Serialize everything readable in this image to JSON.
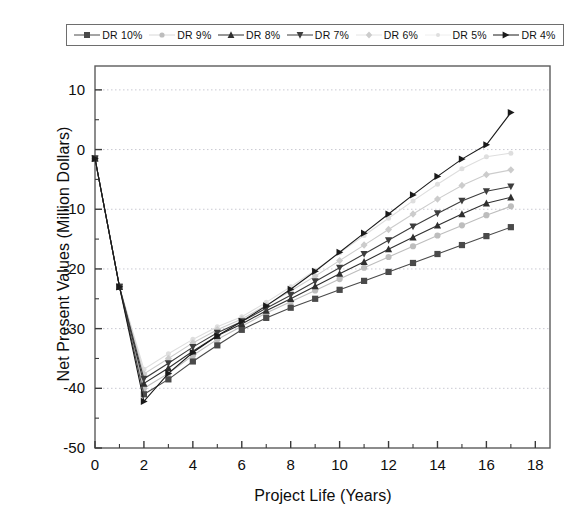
{
  "chart_data": {
    "type": "line",
    "title": "",
    "xlabel": "Project Life (Years)",
    "ylabel": "Net Present Values (Million Dollars)",
    "xlim": [
      0,
      18.6
    ],
    "ylim": [
      -50,
      14
    ],
    "xticks": [
      0,
      2,
      4,
      6,
      8,
      10,
      12,
      14,
      16,
      18
    ],
    "yticks": [
      10,
      0,
      -10,
      -20,
      -30,
      -40,
      -50
    ],
    "xtick_labels": [
      "0",
      "2",
      "4",
      "6",
      "8",
      "10",
      "12",
      "14",
      "16",
      "18"
    ],
    "ytick_labels": [
      "10",
      "0",
      "-10",
      "-20",
      "-30",
      "-40",
      "-50"
    ],
    "x_minor_step": 1,
    "y_minor_step": 5,
    "grid": "horizontal-dotted",
    "legend_position": "top-outside",
    "x": [
      0,
      1,
      2,
      3,
      4,
      5,
      6,
      7,
      8,
      9,
      10,
      11,
      12,
      13,
      14,
      15,
      16,
      17
    ],
    "series": [
      {
        "name": "DR 10%",
        "marker": "square",
        "color": "#4a4a4a",
        "values": [
          -1.5,
          -23.0,
          -41.0,
          -38.5,
          -35.5,
          -32.8,
          -30.2,
          -28.2,
          -26.5,
          -25.0,
          -23.5,
          -22.0,
          -20.5,
          -19.0,
          -17.5,
          -16.0,
          -14.5,
          -13.0
        ]
      },
      {
        "name": "DR 9%",
        "marker": "circle",
        "color": "#bdbdbd",
        "values": [
          -1.5,
          -23.0,
          -40.0,
          -37.5,
          -34.5,
          -31.8,
          -29.6,
          -27.4,
          -25.5,
          -23.6,
          -21.7,
          -19.8,
          -18.0,
          -16.2,
          -14.4,
          -12.7,
          -11.0,
          -9.5
        ]
      },
      {
        "name": "DR 8%",
        "marker": "triangle-up",
        "color": "#2f2f2f",
        "values": [
          -1.5,
          -23.0,
          -39.2,
          -36.6,
          -33.8,
          -31.2,
          -29.2,
          -27.0,
          -25.0,
          -22.9,
          -20.8,
          -18.8,
          -16.7,
          -14.7,
          -12.7,
          -10.8,
          -9.0,
          -8.0
        ]
      },
      {
        "name": "DR 7%",
        "marker": "triangle-down",
        "color": "#3d3d3d",
        "values": [
          -1.5,
          -23.0,
          -38.4,
          -35.8,
          -33.1,
          -30.7,
          -28.8,
          -26.6,
          -24.4,
          -22.1,
          -19.8,
          -17.5,
          -15.2,
          -12.9,
          -10.7,
          -8.6,
          -7.0,
          -6.2
        ]
      },
      {
        "name": "DR 6%",
        "marker": "diamond",
        "color": "#cccccc",
        "values": [
          -1.5,
          -23.0,
          -37.6,
          -35.0,
          -32.4,
          -30.2,
          -28.4,
          -26.1,
          -23.7,
          -21.2,
          -18.6,
          -16.0,
          -13.4,
          -10.8,
          -8.3,
          -6.0,
          -4.2,
          -3.4
        ]
      },
      {
        "name": "DR 5%",
        "marker": "dot",
        "color": "#dedede",
        "values": [
          -1.5,
          -23.0,
          -36.8,
          -34.2,
          -31.8,
          -29.7,
          -28.0,
          -25.6,
          -23.0,
          -20.2,
          -17.3,
          -14.4,
          -11.5,
          -8.6,
          -5.8,
          -3.2,
          -1.2,
          -0.6
        ]
      },
      {
        "name": "DR 4%",
        "marker": "triangle-right",
        "color": "#1a1a1a",
        "values": [
          -1.5,
          -23.0,
          -42.2,
          -37.5,
          -34.0,
          -31.2,
          -28.8,
          -26.2,
          -23.4,
          -20.4,
          -17.2,
          -14.0,
          -10.8,
          -7.6,
          -4.5,
          -1.6,
          0.8,
          6.2
        ]
      }
    ]
  },
  "legend": {
    "entries": [
      {
        "label": "DR 10%"
      },
      {
        "label": "DR 9%"
      },
      {
        "label": "DR 8%"
      },
      {
        "label": "DR 7%"
      },
      {
        "label": "DR 6%"
      },
      {
        "label": "DR 5%"
      },
      {
        "label": "DR 4%"
      }
    ]
  }
}
